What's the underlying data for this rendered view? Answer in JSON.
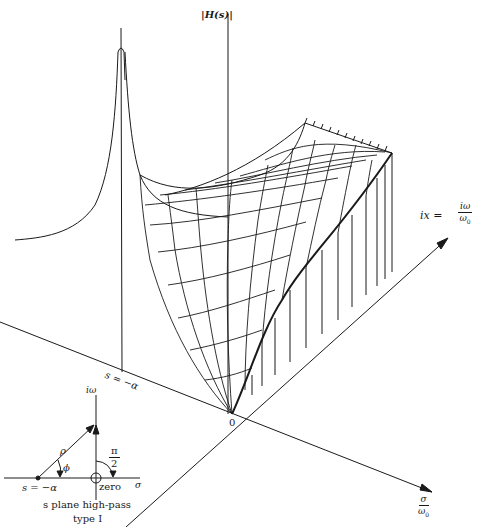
{
  "figure": {
    "vertical_axis_label": "|H(s)|",
    "imag_axis_label_lhs": "ix =",
    "imag_axis_num": "iω",
    "imag_axis_den": "ω",
    "imag_axis_den_sub": "0",
    "real_axis_num": "σ",
    "real_axis_den": "ω",
    "real_axis_den_sub": "0",
    "origin_label": "0",
    "pole_label": "s = −α"
  },
  "inset": {
    "imag_label": "iω",
    "real_label": "σ",
    "rho_label": "ρ",
    "phi_label": "ϕ",
    "angle_num": "π",
    "angle_den": "2",
    "pole_label": "s = −α",
    "zero_label": "zero",
    "caption_line1": "s plane high-pass",
    "caption_line2": "type I"
  },
  "colors": {
    "ink": "#1a1a1a",
    "background": "#ffffff"
  }
}
